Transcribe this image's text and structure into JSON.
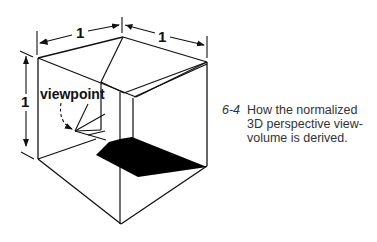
{
  "figure": {
    "number": "6-4",
    "caption_lines": [
      "How the normalized",
      "3D perspective view-",
      "volume is derived."
    ]
  },
  "diagram": {
    "dimension_labels": {
      "top_left_width": "1",
      "top_right_depth": "1",
      "left_height": "1"
    },
    "viewpoint_label": "viewpoint",
    "colors": {
      "stroke": "#111111",
      "fill_shadow": "#000000",
      "background": "#ffffff"
    }
  }
}
